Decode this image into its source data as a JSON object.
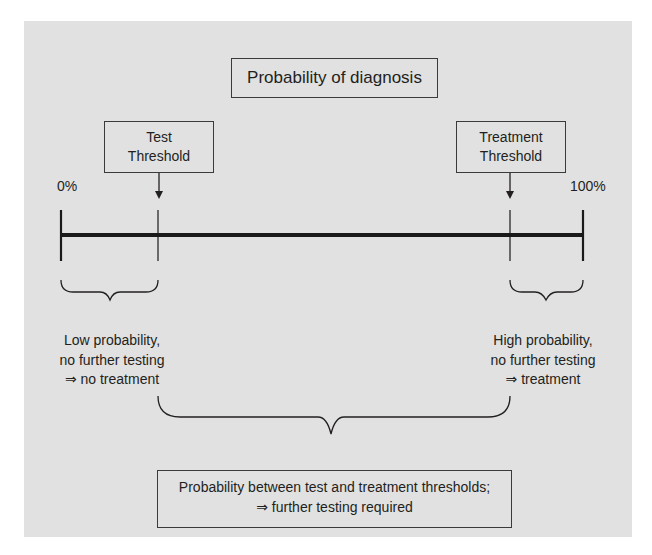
{
  "diagram": {
    "title": "Probability of diagnosis",
    "scale": {
      "min_label": "0%",
      "max_label": "100%"
    },
    "thresholds": [
      {
        "line1": "Test",
        "line2": "Threshold"
      },
      {
        "line1": "Treatment",
        "line2": "Threshold"
      }
    ],
    "regions": {
      "low": {
        "line1": "Low probability,",
        "line2": "no further testing",
        "line3": "⇒ no treatment"
      },
      "high": {
        "line1": "High probability,",
        "line2": "no further testing",
        "line3": "⇒ treatment"
      },
      "middle": {
        "line1": "Probability between test and treatment thresholds;",
        "line2": "⇒ further testing required"
      }
    },
    "colors": {
      "panel": "#e1e1e1",
      "ink": "#231f20"
    }
  }
}
